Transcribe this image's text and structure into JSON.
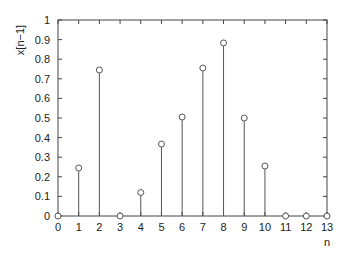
{
  "chart_data": {
    "type": "stem",
    "title": "",
    "xlabel": "n",
    "ylabel": "x[n−1]",
    "x": [
      0,
      1,
      2,
      3,
      4,
      5,
      6,
      7,
      8,
      9,
      10,
      11,
      12,
      13
    ],
    "values": [
      0,
      0.245,
      0.745,
      0,
      0.12,
      0.367,
      0.505,
      0.755,
      0.883,
      0.5,
      0.255,
      0,
      0,
      0
    ],
    "xlim": [
      0,
      13
    ],
    "ylim": [
      0,
      1
    ],
    "xticks": [
      "0",
      "1",
      "2",
      "3",
      "4",
      "5",
      "6",
      "7",
      "8",
      "9",
      "10",
      "11",
      "12",
      "13"
    ],
    "yticks": [
      "0",
      "0.1",
      "0.2",
      "0.3",
      "0.4",
      "0.5",
      "0.6",
      "0.7",
      "0.8",
      "0.9",
      "1"
    ],
    "grid": false,
    "legend": null,
    "marker": "open-circle",
    "color": "#555555"
  }
}
